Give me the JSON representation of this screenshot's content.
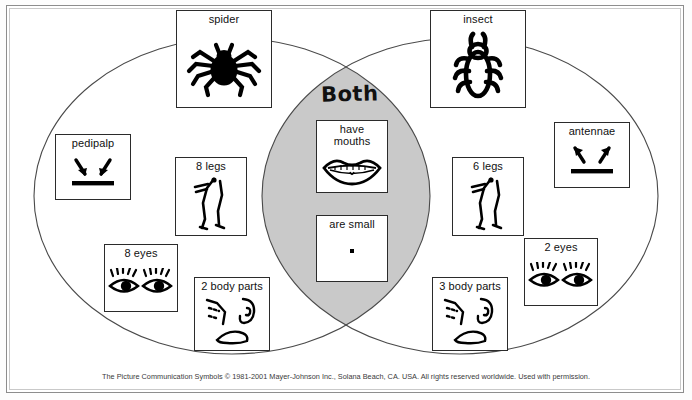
{
  "diagram": {
    "type": "venn",
    "title_center": "Both",
    "left_set": "spider",
    "right_set": "insect",
    "fill_intersection": "#c9c9c9",
    "stroke": "#3a3a3a"
  },
  "cards": {
    "spider": {
      "label": "spider",
      "icon": "spider-icon"
    },
    "insect": {
      "label": "insect",
      "icon": "insect-icon"
    },
    "pedipalp": {
      "label": "pedipalp",
      "icon": "arrows-down-inward-icon"
    },
    "antennae": {
      "label": "antennae",
      "icon": "arrows-up-outward-icon"
    },
    "legs8": {
      "label": "8 legs",
      "icon": "legs-icon"
    },
    "legs6": {
      "label": "6 legs",
      "icon": "legs-icon"
    },
    "eyes8": {
      "label": "8 eyes",
      "icon": "eyes-icon"
    },
    "eyes2": {
      "label": "2 eyes",
      "icon": "eyes-icon"
    },
    "body2": {
      "label": "2 body parts",
      "icon": "body-parts-icon"
    },
    "body3": {
      "label": "3 body parts",
      "icon": "body-parts-icon"
    },
    "mouths": {
      "label": "have\nmouths",
      "icon": "mouth-icon"
    },
    "small": {
      "label": "are small",
      "icon": "small-dot-icon"
    }
  },
  "footer": {
    "text": "The Picture Communication Symbols © 1981-2001 Mayer-Johnson Inc., Solana Beach, CA. USA. All rights reserved worldwide. Used with permission."
  }
}
